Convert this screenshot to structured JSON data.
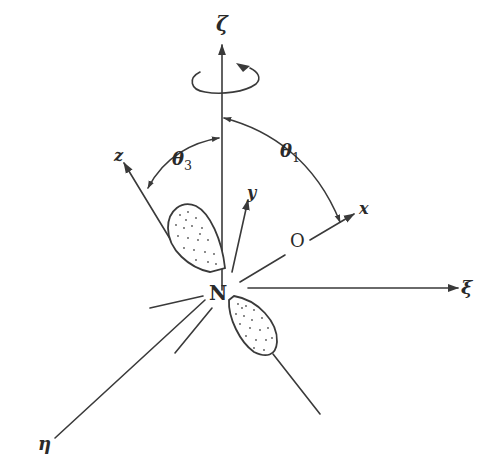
{
  "figure": {
    "type": "molecular-orientation-diagram",
    "labels": {
      "zeta": "ζ",
      "xi": "ξ",
      "eta": "η",
      "x": "x",
      "y": "y",
      "z": "z",
      "nitrogen": "N",
      "oxygen": "O",
      "theta1": "θ",
      "theta1_sub": "1",
      "theta3": "θ",
      "theta3_sub": "3"
    },
    "colors": {
      "line": "#3a3a3a",
      "text": "#2a2a2a",
      "background": "#ffffff"
    },
    "annotations": {
      "rotation_arrow": "circular arrow around ζ axis indicating rotation",
      "theta1_arc": "angle between ζ and x axes",
      "theta3_arc": "angle between ζ and z axes"
    }
  }
}
